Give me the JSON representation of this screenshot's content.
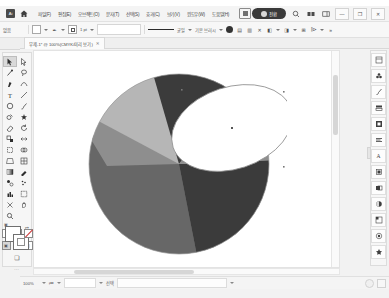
{
  "window": {
    "app_name": "Adobe Illustrator",
    "logo_glyph": "Ai",
    "minimize_label": "—",
    "restore_label": "❐",
    "close_label": "✕"
  },
  "menubar": {
    "home_icon": "home-icon",
    "items": [
      {
        "label": "파일(F)"
      },
      {
        "label": "편집(E)"
      },
      {
        "label": "오브젝트(O)"
      },
      {
        "label": "문자(T)"
      },
      {
        "label": "선택(S)"
      },
      {
        "label": "효과(C)"
      },
      {
        "label": "보기(V)"
      },
      {
        "label": "윈도우(W)"
      },
      {
        "label": "도움말(H)"
      }
    ],
    "badge": {
      "text": "전환",
      "icon": "cloud-sync-icon"
    },
    "search_icon": "search-icon",
    "arrange_icon": "arrange-documents-icon",
    "workspace_icon": "workspace-switcher-icon"
  },
  "controlbar": {
    "no_selection_label": "없음",
    "fill_label": "칠",
    "stroke_label": "획",
    "stroke_weight": "1 pt",
    "variable_width_label": "균일",
    "brush_definition_label": "기본 브러시",
    "opacity_label": "불투명도: 100%",
    "opacity_icon": "opacity-icon",
    "align_label": "정렬",
    "transform_label": "변형",
    "isolate_icon": "isolate-group-icon",
    "mask_icon": "opacity-mask-icon",
    "style_icon": "graphic-style-icon",
    "document_setup_label": "문서 설정",
    "preferences_label": "환경 설정"
  },
  "document_tab": {
    "title": "무제-1* @ 100%(CMYK/미리 보기)",
    "close_glyph": "✕"
  },
  "toolbar": {
    "tools": [
      {
        "name": "selection-tool",
        "glyph": "➤",
        "selected": true
      },
      {
        "name": "direct-selection-tool",
        "glyph": "▷",
        "selected": false
      },
      {
        "name": "magic-wand-tool",
        "glyph": "✦",
        "selected": false
      },
      {
        "name": "lasso-tool",
        "glyph": "◌",
        "selected": false
      },
      {
        "name": "pen-tool",
        "glyph": "✒",
        "selected": false
      },
      {
        "name": "curvature-tool",
        "glyph": "⌒",
        "selected": false
      },
      {
        "name": "type-tool",
        "glyph": "T",
        "selected": false
      },
      {
        "name": "line-segment-tool",
        "glyph": "／",
        "selected": false
      },
      {
        "name": "rectangle-tool",
        "glyph": "▭",
        "selected": false
      },
      {
        "name": "paintbrush-tool",
        "glyph": "🖌",
        "selected": false
      },
      {
        "name": "shaper-tool",
        "glyph": "◍",
        "selected": false
      },
      {
        "name": "blob-brush-tool",
        "glyph": "✽",
        "selected": false
      },
      {
        "name": "eraser-tool",
        "glyph": "◢",
        "selected": false
      },
      {
        "name": "rotate-tool",
        "glyph": "↻",
        "selected": false
      },
      {
        "name": "scale-tool",
        "glyph": "⤢",
        "selected": false
      },
      {
        "name": "width-tool",
        "glyph": "⌁",
        "selected": false
      },
      {
        "name": "free-transform-tool",
        "glyph": "▧",
        "selected": false
      },
      {
        "name": "shape-builder-tool",
        "glyph": "◒",
        "selected": false
      },
      {
        "name": "perspective-grid-tool",
        "glyph": "▦",
        "selected": false
      },
      {
        "name": "mesh-tool",
        "glyph": "▥",
        "selected": false
      },
      {
        "name": "gradient-tool",
        "glyph": "▤",
        "selected": false
      },
      {
        "name": "eyedropper-tool",
        "glyph": "✎",
        "selected": false
      },
      {
        "name": "blend-tool",
        "glyph": "❧",
        "selected": false
      },
      {
        "name": "symbol-sprayer-tool",
        "glyph": "✿",
        "selected": false
      },
      {
        "name": "column-graph-tool",
        "glyph": "▮",
        "selected": false
      },
      {
        "name": "artboard-tool",
        "glyph": "⬚",
        "selected": false
      },
      {
        "name": "slice-tool",
        "glyph": "✂",
        "selected": false
      },
      {
        "name": "hand-tool",
        "glyph": "✋",
        "selected": false
      },
      {
        "name": "zoom-tool",
        "glyph": "⌕",
        "selected": false
      }
    ],
    "fill_swatch_name": "fill-swatch",
    "stroke_swatch_name": "stroke-swatch",
    "swap_glyph": "⇄",
    "default_glyph": "▣",
    "color_modes": [
      "color-fill-mode",
      "gradient-fill-mode",
      "none-fill-mode"
    ],
    "screen_modes": [
      "normal-screen-mode",
      "full-screen-menu-mode",
      "full-screen-mode"
    ],
    "edit_toolbar_glyph": "⋯"
  },
  "canvas": {
    "artwork_name": "beach-ball-sphere",
    "colors": {
      "light_gray": "#b6b6b6",
      "mid_gray": "#8e8e8e",
      "dark_gray": "#666666",
      "darkest_gray": "#3b3b3b",
      "white": "#ffffff",
      "selection_stroke": "#9a9a9a"
    },
    "selected_shape": "ellipse-selected",
    "anchor_point_name": "anchor-point"
  },
  "right_dock": {
    "panels": [
      {
        "name": "properties-panel-icon",
        "glyph": "▦"
      },
      {
        "name": "libraries-panel-icon",
        "glyph": "♣"
      },
      {
        "name": "brushes-panel-icon",
        "glyph": "✒"
      },
      {
        "name": "layers-panel-icon",
        "glyph": "▤"
      },
      {
        "name": "artboards-panel-icon",
        "glyph": "▥"
      },
      {
        "name": "align-panel-icon",
        "glyph": "≡"
      },
      {
        "name": "character-panel-icon",
        "glyph": "A"
      },
      {
        "name": "swatches-panel-icon",
        "glyph": "▩"
      },
      {
        "name": "pathfinder-panel-icon",
        "glyph": "◧"
      },
      {
        "name": "gradient-panel-icon",
        "glyph": "◐"
      },
      {
        "name": "transform-panel-icon",
        "glyph": "⊞"
      },
      {
        "name": "appearance-panel-icon",
        "glyph": "◉"
      },
      {
        "name": "symbols-panel-icon",
        "glyph": "❖"
      }
    ]
  },
  "statusbar": {
    "zoom_level": "100%",
    "artboard_nav_icon": "artboard-navigation-icon",
    "artboard_number": "1",
    "selection_label": "선택",
    "status_text": "",
    "notifications_icon": "notifications-icon",
    "resize_grip": "resize-grip-icon"
  }
}
